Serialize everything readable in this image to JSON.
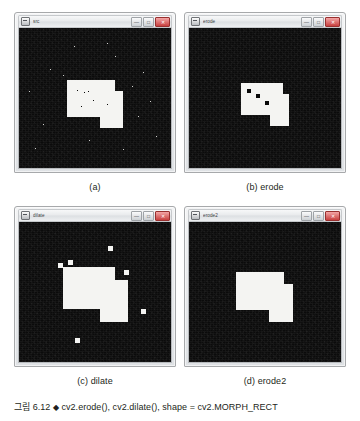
{
  "figure": {
    "caption_label": "그림 6.12",
    "caption_marker": "◆",
    "caption_text": "cv2.erode(), cv2.dilate(),  shape = cv2.MORPH_RECT"
  },
  "windows": [
    {
      "title": "src",
      "subcaption": "(a)",
      "icon": "app-icon",
      "buttons": {
        "minimize": "—",
        "maximize": "□",
        "close": "✕"
      },
      "image": {
        "description": "binary source image: L-shaped white region on black noisy background with salt-and-pepper noise",
        "background_color": "#0b0b0b",
        "foreground_color": "#f4f4f2"
      }
    },
    {
      "title": "erode",
      "subcaption": "(b) erode",
      "icon": "app-icon",
      "buttons": {
        "minimize": "—",
        "maximize": "□",
        "close": "✕"
      },
      "image": {
        "description": "eroded image: white region shrunk, pepper holes enlarged into black squares, white specks removed",
        "background_color": "#0b0b0b",
        "foreground_color": "#f4f4f2"
      }
    },
    {
      "title": "dilate",
      "subcaption": "(c) dilate",
      "icon": "app-icon",
      "buttons": {
        "minimize": "—",
        "maximize": "□",
        "close": "✕"
      },
      "image": {
        "description": "dilated image: white region grown, salt noise enlarged into white squares, holes filled",
        "background_color": "#0b0b0b",
        "foreground_color": "#f4f4f2"
      }
    },
    {
      "title": "erode2",
      "subcaption": "(d) erode2",
      "icon": "app-icon",
      "buttons": {
        "minimize": "—",
        "maximize": "□",
        "close": "✕"
      },
      "image": {
        "description": "erode applied to dilated image: clean L-shaped white region, all noise removed",
        "background_color": "#0b0b0b",
        "foreground_color": "#f4f4f2"
      }
    }
  ]
}
